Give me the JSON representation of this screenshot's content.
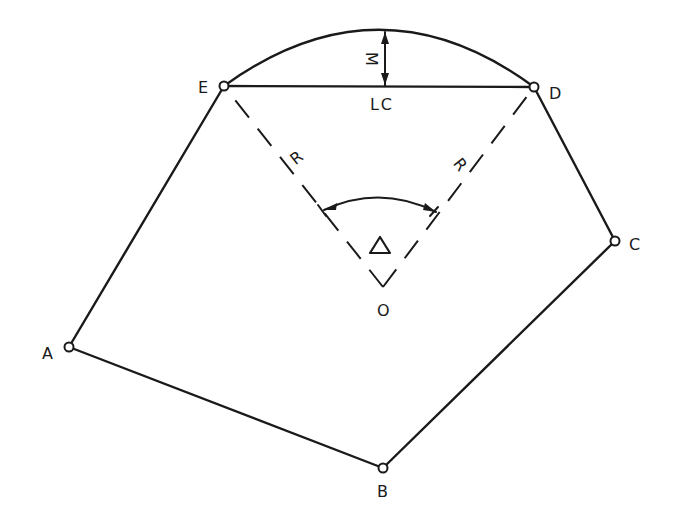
{
  "diagram": {
    "points": {
      "A": {
        "label": "A",
        "x": 69,
        "y": 347
      },
      "B": {
        "label": "B",
        "x": 383,
        "y": 468
      },
      "C": {
        "label": "C",
        "x": 615,
        "y": 241
      },
      "D": {
        "label": "D",
        "x": 534,
        "y": 87
      },
      "E": {
        "label": "E",
        "x": 224,
        "y": 86
      },
      "O": {
        "label": "O",
        "x": 383,
        "y": 287
      }
    },
    "labels": {
      "long_chord": "LC",
      "middle_ordinate": "M",
      "radius_left": "R",
      "radius_right": "R",
      "central_angle": "Δ",
      "center": "O"
    },
    "edges": [
      {
        "from": "A",
        "to": "B",
        "style": "solid"
      },
      {
        "from": "B",
        "to": "C",
        "style": "solid"
      },
      {
        "from": "C",
        "to": "D",
        "style": "solid"
      },
      {
        "from": "E",
        "to": "A",
        "style": "solid"
      },
      {
        "from": "E",
        "to": "D",
        "style": "solid",
        "name": "long chord"
      },
      {
        "from": "O",
        "to": "E",
        "style": "dashed",
        "name": "radius"
      },
      {
        "from": "O",
        "to": "D",
        "style": "dashed",
        "name": "radius"
      }
    ],
    "curve": {
      "from": "E",
      "to": "D",
      "apex_y": 30
    },
    "colors": {
      "ink": "#1a1a1a",
      "background": "#ffffff"
    }
  }
}
